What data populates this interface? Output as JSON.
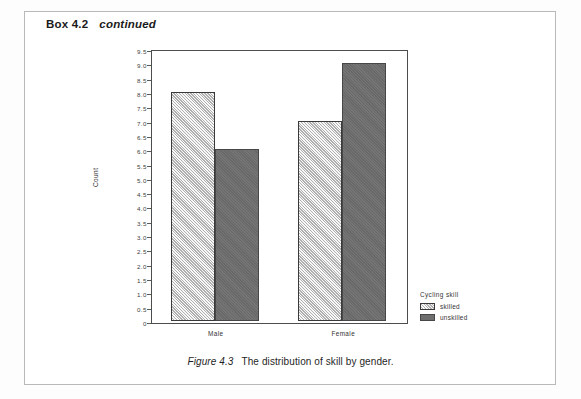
{
  "box": {
    "label": "Box 4.2",
    "continued": "continued"
  },
  "caption": {
    "figure_number": "Figure 4.3",
    "text": "The distribution of skill by gender."
  },
  "legend": {
    "title": "Cycling skill",
    "items": [
      {
        "label": "skilled",
        "color": "#cfcfcf"
      },
      {
        "label": "unskilled",
        "color": "#6e6e6e"
      }
    ]
  },
  "chart_data": {
    "type": "bar",
    "title": "",
    "xlabel": "",
    "ylabel": "Count",
    "categories": [
      "Male",
      "Female"
    ],
    "series": [
      {
        "name": "skilled",
        "values": [
          8,
          7
        ],
        "color": "#cfcfcf"
      },
      {
        "name": "unskilled",
        "values": [
          6,
          9
        ],
        "color": "#6e6e6e"
      }
    ],
    "ylim": [
      0,
      9.5
    ],
    "ytick_step": 0.5,
    "ytick_labels": [
      "9.5",
      "9.0",
      "8.5",
      "8.0",
      "7.5",
      "7.0",
      "6.5",
      "6.0",
      "5.5",
      "5.0",
      "4.5",
      "4.0",
      "3.5",
      "3.0",
      "2.5",
      "2.0",
      "1.5",
      "1.0",
      "0.5",
      "0"
    ],
    "grid": false,
    "legend_position": "right-bottom"
  }
}
